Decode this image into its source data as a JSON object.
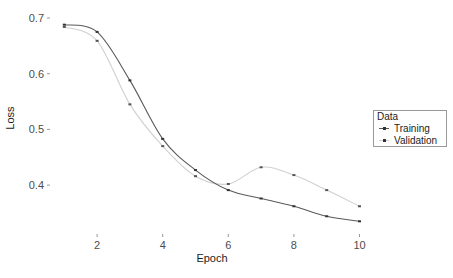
{
  "chart_data": {
    "type": "line",
    "title": "",
    "xlabel": "Epoch",
    "ylabel": "Loss",
    "x": [
      1,
      2,
      3,
      4,
      5,
      6,
      7,
      8,
      9,
      10
    ],
    "xticks": [
      "2",
      "4",
      "6",
      "8",
      "10"
    ],
    "yticks": [
      "0.4",
      "0.5",
      "0.6",
      "0.7"
    ],
    "xlim": [
      0.8,
      10.2
    ],
    "ylim": [
      0.32,
      0.705
    ],
    "grid": false,
    "legend_position": "right",
    "legend_title": "Data",
    "series": [
      {
        "name": "Training",
        "values": [
          0.688,
          0.675,
          0.588,
          0.483,
          0.427,
          0.391,
          0.376,
          0.362,
          0.344,
          0.335
        ],
        "line_color": "#5a5a5a",
        "point_color": "#333333"
      },
      {
        "name": "Validation",
        "values": [
          0.684,
          0.659,
          0.545,
          0.47,
          0.416,
          0.402,
          0.432,
          0.418,
          0.391,
          0.362
        ],
        "line_color": "#d0d0d0",
        "point_color": "#555555"
      }
    ]
  },
  "legend": {
    "title": "Data",
    "items": [
      {
        "label": "Training"
      },
      {
        "label": "Validation"
      }
    ]
  }
}
